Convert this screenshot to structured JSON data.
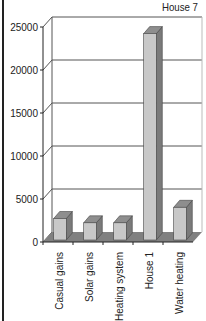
{
  "chart_data": {
    "type": "bar",
    "style": "3d-column",
    "title": "House 7",
    "xlabel": "",
    "ylabel": "",
    "categories": [
      "Casual gains",
      "Solar gains",
      "Heating system",
      "House 1",
      "Water heating"
    ],
    "values": [
      2500,
      2000,
      2000,
      24000,
      3800
    ],
    "ylim": [
      0,
      25000
    ],
    "yticks": [
      "0",
      "5000",
      "10000",
      "15000",
      "20000",
      "25000"
    ],
    "grid": true,
    "legend": null
  },
  "colors": {
    "bar_front": "#c8c8c8",
    "bar_top": "#8e8e8e",
    "bar_side": "#7a7a7a",
    "floor": "#808080",
    "grid": "#555555",
    "frame": "#222222"
  }
}
